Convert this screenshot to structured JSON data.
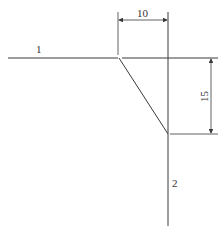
{
  "diagram": {
    "labels": {
      "line1": "1",
      "line2": "2"
    },
    "dimensions": {
      "horizontal_offset": "10",
      "vertical_offset": "15"
    },
    "colors": {
      "stroke": "#3a3a3a",
      "text": "#333333",
      "background": "#ffffff"
    }
  }
}
